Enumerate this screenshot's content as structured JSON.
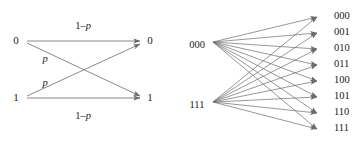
{
  "figure": {
    "name": "channel-diagrams",
    "background_color": "#ffffff",
    "line_color": "#6b6b6b",
    "text_color": "#1a1a1a"
  },
  "left_diagram": {
    "name": "binary-symmetric-channel",
    "inputs": [
      {
        "label": "0",
        "x": 16,
        "y": 41
      },
      {
        "label": "1",
        "x": 16,
        "y": 98
      }
    ],
    "outputs": [
      {
        "label": "0",
        "x": 150,
        "y": 41
      },
      {
        "label": "1",
        "x": 150,
        "y": 98
      }
    ],
    "edges": [
      {
        "from": "0",
        "to": "0",
        "label": "1-p",
        "label_x": 83,
        "label_y": 27
      },
      {
        "from": "0",
        "to": "1",
        "label": "p",
        "label_x": 45,
        "label_y": 60
      },
      {
        "from": "1",
        "to": "0",
        "label": "p",
        "label_x": 45,
        "label_y": 84
      },
      {
        "from": "1",
        "to": "1",
        "label": "1-p",
        "label_x": 83,
        "label_y": 117
      }
    ],
    "labels": {
      "one_minus_p_prefix": "1–",
      "p_symbol": "p"
    }
  },
  "right_diagram": {
    "name": "repetition-code-channel",
    "inputs": [
      {
        "label": "000",
        "x": 197,
        "y": 46
      },
      {
        "label": "111",
        "x": 197,
        "y": 106
      }
    ],
    "outputs": [
      {
        "label": "000",
        "y": 17
      },
      {
        "label": "001",
        "y": 33
      },
      {
        "label": "010",
        "y": 49
      },
      {
        "label": "011",
        "y": 65
      },
      {
        "label": "100",
        "y": 81
      },
      {
        "label": "101",
        "y": 97
      },
      {
        "label": "110",
        "y": 113
      },
      {
        "label": "111",
        "y": 129
      }
    ],
    "fan_origins": [
      {
        "from": "000",
        "x": 213,
        "y": 42
      },
      {
        "from": "111",
        "x": 213,
        "y": 102
      }
    ],
    "output_node_x": 327,
    "output_label_x": 334
  }
}
